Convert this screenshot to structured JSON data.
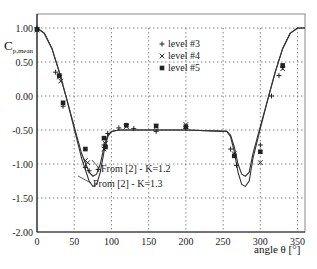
{
  "chart_data": {
    "type": "scatter",
    "title": "",
    "xlabel": "angle θ [°]",
    "ylabel": "Cp,mean",
    "ylabel_main": "C",
    "ylabel_sub": "p,mean",
    "xlim": [
      0,
      360
    ],
    "ylim": [
      -2.0,
      1.0
    ],
    "xticks": [
      0,
      50,
      100,
      150,
      200,
      250,
      300,
      350
    ],
    "yticks": [
      1.0,
      0.5,
      0.0,
      -0.5,
      -1.0,
      -1.5,
      -2.0
    ],
    "ytick_labels": [
      "1.00",
      "0.50",
      "0.00",
      "-0.50",
      "-1.00",
      "-1.50",
      "-2.00"
    ],
    "grid": true,
    "legend_position": "upper-middle",
    "legend": [
      {
        "name": "level #3",
        "marker": "+"
      },
      {
        "name": "level #4",
        "marker": "x"
      },
      {
        "name": "level #5",
        "marker": "square"
      }
    ],
    "series": [
      {
        "name": "level #3",
        "marker": "+",
        "x": [
          0,
          25,
          30,
          35,
          65,
          70,
          82,
          90,
          95,
          110,
          130,
          160,
          200,
          260,
          268,
          300,
          315,
          325,
          330
        ],
        "y": [
          1.0,
          0.35,
          0.3,
          -0.15,
          -1.05,
          -1.1,
          -1.08,
          -0.72,
          -0.55,
          -0.47,
          -0.48,
          -0.52,
          -0.48,
          -0.78,
          -1.02,
          -0.72,
          0.0,
          0.3,
          0.42
        ]
      },
      {
        "name": "level #4",
        "marker": "x",
        "x": [
          0,
          30,
          32,
          65,
          68,
          90,
          92,
          120,
          160,
          200,
          265,
          300,
          330
        ],
        "y": [
          0.97,
          0.28,
          0.22,
          -0.95,
          -0.98,
          -0.78,
          -0.7,
          -0.45,
          -0.45,
          -0.42,
          -0.85,
          -0.98,
          0.4
        ],
        "note": "approximate"
      },
      {
        "name": "level #5",
        "marker": "square",
        "x": [
          0,
          30,
          35,
          65,
          90,
          92,
          120,
          160,
          200,
          265,
          300,
          330
        ],
        "y": [
          0.98,
          0.3,
          -0.1,
          -0.78,
          -0.62,
          -0.75,
          -0.43,
          -0.44,
          -0.45,
          -0.88,
          -0.82,
          0.45
        ],
        "note": "approximate"
      },
      {
        "name": "From [2] - K=1.2",
        "type": "line",
        "x": [
          0,
          10,
          20,
          30,
          40,
          50,
          60,
          70,
          75,
          80,
          85,
          90,
          95,
          100,
          110,
          200,
          255,
          260,
          265,
          270,
          275,
          280,
          285,
          290,
          300,
          310,
          320,
          330,
          340,
          350,
          360
        ],
        "y": [
          1.0,
          0.92,
          0.7,
          0.35,
          -0.05,
          -0.45,
          -0.85,
          -1.12,
          -1.18,
          -1.15,
          -1.0,
          -0.75,
          -0.58,
          -0.52,
          -0.5,
          -0.5,
          -0.52,
          -0.58,
          -0.75,
          -1.0,
          -1.15,
          -1.18,
          -1.12,
          -0.85,
          -0.45,
          -0.05,
          0.35,
          0.7,
          0.92,
          1.0,
          1.0
        ]
      },
      {
        "name": "From [2] - K=1.3",
        "type": "line",
        "x": [
          0,
          10,
          20,
          30,
          40,
          50,
          60,
          70,
          75,
          80,
          85,
          90,
          95,
          100,
          110,
          200,
          255,
          260,
          265,
          270,
          275,
          280,
          285,
          290,
          300,
          310,
          320,
          330,
          340,
          350,
          360
        ],
        "y": [
          1.0,
          0.92,
          0.7,
          0.35,
          -0.05,
          -0.48,
          -0.92,
          -1.25,
          -1.33,
          -1.3,
          -1.12,
          -0.82,
          -0.6,
          -0.52,
          -0.5,
          -0.5,
          -0.52,
          -0.6,
          -0.82,
          -1.12,
          -1.3,
          -1.33,
          -1.25,
          -0.92,
          -0.48,
          -0.05,
          0.35,
          0.7,
          0.92,
          1.0,
          1.0
        ]
      }
    ],
    "annotations": [
      {
        "text": "From [2] - K=1.2",
        "x": 95,
        "y": -1.1
      },
      {
        "text": "From [2] - K=1.3",
        "x": 88,
        "y": -1.38
      }
    ]
  }
}
